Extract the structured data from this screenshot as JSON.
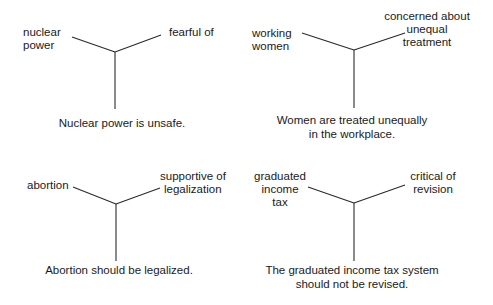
{
  "diagrams": [
    {
      "topic_label": [
        "nuclear",
        "power"
      ],
      "attitude_label": [
        "fearful of"
      ],
      "belief": [
        "Nuclear power is unsafe."
      ]
    },
    {
      "topic_label": [
        "working",
        "women"
      ],
      "attitude_label": [
        "concerned about",
        "unequal",
        "treatment"
      ],
      "belief": [
        "Women are treated unequally",
        "in the workplace."
      ]
    },
    {
      "topic_label": [
        "abortion"
      ],
      "attitude_label": [
        "supportive of",
        "legalization"
      ],
      "belief": [
        "Abortion should be legalized."
      ]
    },
    {
      "topic_label": [
        "graduated",
        "income",
        "tax"
      ],
      "attitude_label": [
        "critical of",
        "revision"
      ],
      "belief": [
        "The graduated income tax system",
        "should not be revised."
      ]
    }
  ],
  "colors": {
    "line": "#2a2a2a",
    "text": "#1a1a1a",
    "background": "#ffffff"
  }
}
